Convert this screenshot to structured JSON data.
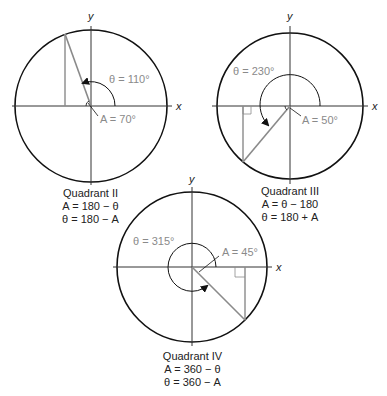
{
  "diagrams": [
    {
      "id": "q2",
      "center": [
        91,
        106
      ],
      "radius": 76,
      "theta_label": "θ = 110°",
      "ref_label": "A = 70°",
      "caption": [
        "Quadrant II",
        "A = 180 − θ",
        "θ = 180 − A"
      ]
    },
    {
      "id": "q3",
      "center": [
        290,
        106
      ],
      "radius": 73,
      "theta_label": "θ = 230°",
      "ref_label": "A = 50°",
      "caption": [
        "Quadrant III",
        "A = θ − 180",
        "θ = 180 + A"
      ]
    },
    {
      "id": "q4",
      "center": [
        192,
        267
      ],
      "radius": 75,
      "theta_label": "θ = 315°",
      "ref_label": "A = 45°",
      "caption": [
        "Quadrant IV",
        "A = 360 − θ",
        "θ = 360 − A"
      ]
    }
  ],
  "axis_labels": {
    "x": "x",
    "y": "y"
  },
  "colors": {
    "circle": "#111111",
    "axis": "#333333",
    "triangle": "#8a8a8a",
    "label": "#8a8a8a"
  }
}
